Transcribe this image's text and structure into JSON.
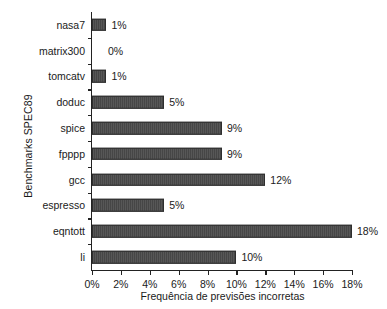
{
  "chart_data": {
    "type": "bar",
    "orientation": "horizontal",
    "title": "",
    "xlabel": "Frequência de previsões incorretas",
    "ylabel": "Benchmarks SPEC89",
    "categories": [
      "nasa7",
      "matrix300",
      "tomcatv",
      "doduc",
      "spice",
      "fpppp",
      "gcc",
      "espresso",
      "eqntott",
      "li"
    ],
    "values": [
      1,
      0,
      1,
      5,
      9,
      9,
      12,
      5,
      18,
      10
    ],
    "data_labels": [
      "1%",
      "0%",
      "1%",
      "5%",
      "9%",
      "9%",
      "12%",
      "5%",
      "18%",
      "10%"
    ],
    "xlim": [
      0,
      18
    ],
    "xticks": [
      0,
      2,
      4,
      6,
      8,
      10,
      12,
      14,
      16,
      18
    ],
    "xtick_labels": [
      "0%",
      "2%",
      "4%",
      "6%",
      "8%",
      "10%",
      "12%",
      "14%",
      "16%",
      "18%"
    ],
    "grid": false,
    "legend": null,
    "bar_color": "#4a4a4a",
    "bar_edge_color": "#2e2e2e",
    "background_color": "#ffffff",
    "text_color": "#1a1a1a"
  }
}
